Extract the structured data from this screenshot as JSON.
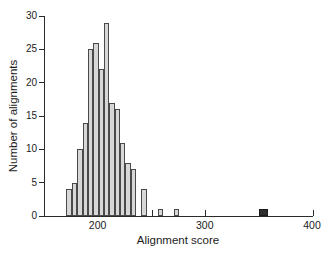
{
  "chart_data": {
    "type": "bar",
    "subtype": "histogram",
    "title": "",
    "xlabel": "Alignment score",
    "ylabel": "Number of alignments",
    "xlim": [
      150,
      400
    ],
    "ylim": [
      0,
      30
    ],
    "bin_width": 5,
    "grid": false,
    "legend": "none",
    "x_major_ticks": [
      200,
      300,
      400
    ],
    "x_minor_ticks": [
      250,
      350
    ],
    "y_ticks": [
      0,
      5,
      10,
      15,
      20,
      25,
      30
    ],
    "bars": [
      {
        "score": 170,
        "count": 4
      },
      {
        "score": 175,
        "count": 5
      },
      {
        "score": 180,
        "count": 10
      },
      {
        "score": 185,
        "count": 14
      },
      {
        "score": 190,
        "count": 25
      },
      {
        "score": 195,
        "count": 26
      },
      {
        "score": 200,
        "count": 22
      },
      {
        "score": 205,
        "count": 29
      },
      {
        "score": 210,
        "count": 17
      },
      {
        "score": 215,
        "count": 16
      },
      {
        "score": 220,
        "count": 11
      },
      {
        "score": 225,
        "count": 8
      },
      {
        "score": 230,
        "count": 7
      },
      {
        "score": 240,
        "count": 4
      },
      {
        "score": 255,
        "count": 1
      },
      {
        "score": 270,
        "count": 1
      },
      {
        "score": 350,
        "count": 1,
        "highlight": true,
        "width": 8
      }
    ],
    "colors": {
      "bar_fill": "#d7d7d7",
      "bar_stroke": "#4a4a4a",
      "highlight_fill": "#2e2e2e",
      "highlight_stroke": "#1a1a1a",
      "axis": "#2b2b2b",
      "text": "#1c1c1c",
      "background": "#ffffff"
    }
  }
}
